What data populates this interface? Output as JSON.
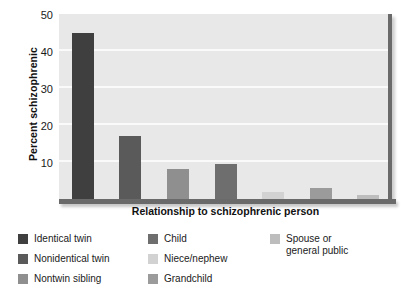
{
  "chart_data": {
    "type": "bar",
    "title": "",
    "xlabel": "Relationship to schizophrenic person",
    "ylabel": "Percent schizophrenic",
    "categories": [
      "Identical twin",
      "Nonidentical twin",
      "Nontwin sibling",
      "Child",
      "Niece/nephew",
      "Grandchild",
      "Spouse or general public"
    ],
    "values": [
      45,
      17,
      8,
      9.5,
      2,
      3,
      1
    ],
    "ylim": [
      0,
      50
    ],
    "yticks": [
      10,
      20,
      30,
      40,
      50
    ],
    "ytick_labels": [
      "10",
      "20",
      "30",
      "40",
      "50"
    ],
    "grid": true,
    "legend_position": "bottom",
    "bar_colors": [
      "#3f3f3f",
      "#5a5a5a",
      "#8f8f8f",
      "#6e6e6e",
      "#d2d2d2",
      "#9b9b9b",
      "#bdbdbd"
    ],
    "plot_background": "#e8e8e8",
    "gridline_color": "#fafafa",
    "axis_color": "#6a6a6a"
  },
  "legend": {
    "columns": [
      {
        "items": [
          {
            "label": "Identical twin",
            "color": "#3f3f3f"
          },
          {
            "label": "Nonidentical twin",
            "color": "#5a5a5a"
          },
          {
            "label": "Nontwin sibling",
            "color": "#8f8f8f"
          }
        ]
      },
      {
        "items": [
          {
            "label": "Child",
            "color": "#6e6e6e"
          },
          {
            "label": "Niece/nephew",
            "color": "#d2d2d2"
          },
          {
            "label": "Grandchild",
            "color": "#9b9b9b"
          }
        ]
      },
      {
        "items": [
          {
            "label": "Spouse or\ngeneral public",
            "color": "#bdbdbd"
          }
        ]
      }
    ]
  }
}
